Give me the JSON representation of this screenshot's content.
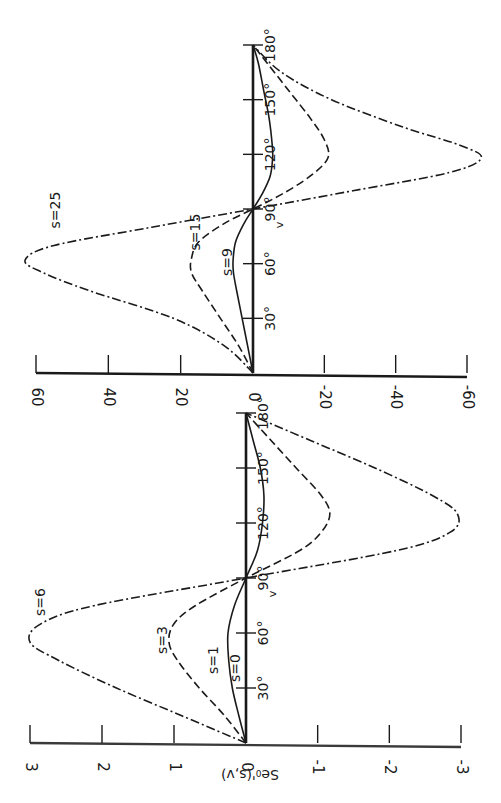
{
  "figure": {
    "orientation": "rotated 90 degrees clockwise",
    "ylabel": "Se₀'(s,v)",
    "xlabel": "v",
    "ink_color": "#1a1a1a",
    "background": "#ffffff"
  },
  "chart_data": [
    {
      "type": "line",
      "panel": "upper",
      "title": "",
      "xlabel": "v",
      "ylabel": "Se₀'(s,v)",
      "xlim": [
        0,
        180
      ],
      "ylim": [
        -60,
        60
      ],
      "x_ticks": [
        0,
        30,
        60,
        90,
        120,
        150,
        180
      ],
      "x_tick_labels": [
        "0",
        "30°",
        "60°",
        "90°",
        "120°",
        "150°",
        "180°"
      ],
      "y_ticks": [
        60,
        40,
        20,
        0,
        -20,
        -40,
        -60
      ],
      "y_tick_labels": [
        "60",
        "40",
        "20",
        "0",
        "-20",
        "-40",
        "-60"
      ],
      "grid": false,
      "legend": "inline labels",
      "series": [
        {
          "name": "s=25",
          "style": "dash-dot",
          "x": [
            0,
            15,
            30,
            45,
            55,
            62,
            70,
            80,
            90,
            100,
            110,
            118,
            125,
            135,
            150,
            165,
            180
          ],
          "values": [
            0,
            8,
            22,
            45,
            58,
            63,
            55,
            28,
            0,
            -28,
            -55,
            -64,
            -58,
            -42,
            -22,
            -8,
            0
          ]
        },
        {
          "name": "s=15",
          "style": "dashed",
          "x": [
            0,
            15,
            30,
            45,
            55,
            63,
            72,
            82,
            90,
            98,
            108,
            118,
            128,
            140,
            155,
            170,
            180
          ],
          "values": [
            0,
            4,
            9,
            14,
            17,
            17,
            15,
            8,
            0,
            -8,
            -16,
            -21,
            -20,
            -16,
            -10,
            -4,
            0
          ]
        },
        {
          "name": "s=9",
          "style": "solid",
          "x": [
            0,
            15,
            30,
            45,
            55,
            62,
            72,
            82,
            90,
            98,
            108,
            118,
            125,
            140,
            155,
            170,
            180
          ],
          "values": [
            0,
            1.5,
            3,
            4.5,
            5.4,
            5.5,
            4.8,
            2.5,
            0,
            -2.5,
            -4.8,
            -5.5,
            -5.4,
            -4.5,
            -3,
            -1.5,
            0
          ]
        }
      ]
    },
    {
      "type": "line",
      "panel": "lower",
      "title": "",
      "xlabel": "v",
      "ylabel": "Se₀'(s,v)",
      "xlim": [
        0,
        180
      ],
      "ylim": [
        -3,
        3
      ],
      "x_ticks": [
        0,
        30,
        60,
        90,
        120,
        150,
        180
      ],
      "x_tick_labels": [
        "0",
        "30°",
        "60°",
        "90°",
        "120°",
        "150°",
        "180°"
      ],
      "y_ticks": [
        3,
        2,
        1,
        0,
        -1,
        -2,
        -3
      ],
      "y_tick_labels": [
        "3",
        "2",
        "1",
        "0",
        "-1",
        "-2",
        "-3"
      ],
      "grid": false,
      "legend": "inline labels",
      "series": [
        {
          "name": "s=6",
          "style": "dash-dot",
          "x": [
            0,
            15,
            30,
            45,
            55,
            65,
            75,
            90,
            105,
            115,
            125,
            135,
            150,
            165,
            180
          ],
          "values": [
            0,
            0.9,
            1.8,
            2.6,
            3.0,
            2.85,
            2.1,
            0,
            -2.1,
            -2.85,
            -2.95,
            -2.6,
            -1.8,
            -0.9,
            0
          ]
        },
        {
          "name": "s=3",
          "style": "dashed",
          "x": [
            0,
            15,
            30,
            45,
            55,
            65,
            75,
            90,
            105,
            115,
            125,
            135,
            150,
            165,
            180
          ],
          "values": [
            0,
            0.3,
            0.65,
            0.95,
            1.07,
            1.0,
            0.7,
            0,
            -0.75,
            -1.05,
            -1.17,
            -1.05,
            -0.7,
            -0.35,
            0
          ]
        },
        {
          "name": "s=1",
          "style": "solid",
          "x": [
            0,
            15,
            30,
            45,
            60,
            75,
            90,
            105,
            120,
            135,
            150,
            165,
            180
          ],
          "values": [
            0,
            0.1,
            0.19,
            0.24,
            0.25,
            0.16,
            0,
            -0.16,
            -0.23,
            -0.25,
            -0.2,
            -0.1,
            0
          ]
        },
        {
          "name": "s=0",
          "style": "solid",
          "x": [
            0,
            180
          ],
          "values": [
            0,
            0
          ]
        }
      ]
    }
  ]
}
